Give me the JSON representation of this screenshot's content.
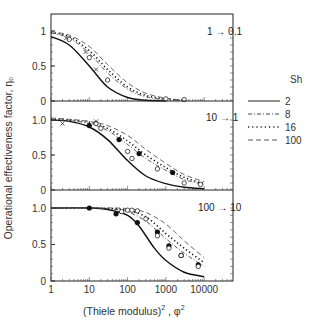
{
  "chart_data": {
    "type": "line",
    "title": "",
    "xlabel": "(Thiele modulus)^2 , φ^2",
    "xlabel_parts": {
      "main": "(Thiele modulus)",
      "sup1": "2",
      "sep": " , φ",
      "sup2": "2"
    },
    "ylabel": "Operational effectiveness factor, η₀",
    "xscale": "log",
    "xlim": [
      1,
      50000
    ],
    "x_ticks": [
      "1",
      "10",
      "100",
      "1000",
      "10000"
    ],
    "legend": {
      "title": "Sh",
      "position": "right",
      "entries": [
        {
          "label": "2",
          "style": "solid"
        },
        {
          "label": "8",
          "style": "dash-dot"
        },
        {
          "label": "16",
          "style": "dotted"
        },
        {
          "label": "100",
          "style": "dashed"
        }
      ]
    },
    "panels": [
      {
        "annotation": "1 → 0.1",
        "y_ticks": [
          "0",
          "0.5",
          "1"
        ],
        "ylim": [
          0,
          1.1
        ],
        "series": [
          {
            "name": "Sh=2",
            "x": [
              1,
              3,
              10,
              30,
              100,
              300,
              1000
            ],
            "y": [
              0.92,
              0.8,
              0.5,
              0.2,
              0.05,
              0.01,
              0.0
            ]
          },
          {
            "name": "Sh=8",
            "x": [
              1,
              3,
              10,
              30,
              100,
              300,
              1000,
              3000
            ],
            "y": [
              0.97,
              0.9,
              0.68,
              0.4,
              0.17,
              0.06,
              0.02,
              0.01
            ]
          },
          {
            "name": "Sh=16",
            "x": [
              1,
              3,
              10,
              30,
              100,
              300,
              1000,
              3000
            ],
            "y": [
              0.98,
              0.92,
              0.72,
              0.45,
              0.2,
              0.08,
              0.03,
              0.01
            ]
          },
          {
            "name": "Sh=100",
            "x": [
              1,
              3,
              10,
              30,
              100,
              300,
              1000,
              3000
            ],
            "y": [
              0.99,
              0.94,
              0.78,
              0.52,
              0.26,
              0.11,
              0.04,
              0.01
            ]
          }
        ],
        "points": {
          "open_circle": [
            [
              3,
              0.88
            ],
            [
              10,
              0.62
            ],
            [
              30,
              0.3
            ],
            [
              1000,
              0.03
            ],
            [
              3000,
              0.02
            ]
          ],
          "cross": [
            [
              2.5,
              0.9
            ],
            [
              8,
              0.7
            ],
            [
              15,
              0.45
            ]
          ]
        }
      },
      {
        "annotation": "10 → 1",
        "y_ticks": [
          "0",
          "0.5",
          "1.0"
        ],
        "ylim": [
          0,
          1.1
        ],
        "series": [
          {
            "name": "Sh=2",
            "x": [
              1,
              3,
              10,
              30,
              100,
              300,
              1000,
              3000,
              10000
            ],
            "y": [
              1.0,
              0.98,
              0.9,
              0.72,
              0.42,
              0.2,
              0.09,
              0.04,
              0.02
            ]
          },
          {
            "name": "Sh=8",
            "x": [
              1,
              3,
              10,
              30,
              100,
              300,
              1000,
              3000,
              10000
            ],
            "y": [
              1.0,
              0.99,
              0.95,
              0.85,
              0.65,
              0.45,
              0.28,
              0.15,
              0.08
            ]
          },
          {
            "name": "Sh=16",
            "x": [
              1,
              3,
              10,
              30,
              100,
              300,
              1000,
              3000,
              10000
            ],
            "y": [
              1.02,
              1.0,
              0.97,
              0.88,
              0.7,
              0.5,
              0.32,
              0.18,
              0.09
            ]
          },
          {
            "name": "Sh=100",
            "x": [
              1,
              3,
              10,
              30,
              100,
              300,
              1000,
              3000,
              10000
            ],
            "y": [
              1.03,
              1.01,
              0.98,
              0.92,
              0.78,
              0.58,
              0.38,
              0.22,
              0.12
            ]
          }
        ],
        "points": {
          "filled_circle": [
            [
              10,
              0.92
            ],
            [
              60,
              0.72
            ],
            [
              200,
              0.52
            ],
            [
              1500,
              0.25
            ]
          ],
          "open_circle": [
            [
              15,
              0.95
            ],
            [
              20,
              0.88
            ],
            [
              100,
              0.55
            ],
            [
              130,
              0.45
            ],
            [
              600,
              0.3
            ],
            [
              3000,
              0.1
            ],
            [
              8000,
              0.08
            ]
          ],
          "cross": [
            [
              2,
              0.95
            ],
            [
              15,
              0.98
            ]
          ]
        }
      },
      {
        "annotation": "100 → 10",
        "y_ticks": [
          "0",
          "0.5",
          "1.0"
        ],
        "ylim": [
          0,
          1.1
        ],
        "series": [
          {
            "name": "Sh=2",
            "x": [
              1,
              10,
              30,
              100,
              200,
              500,
              1000,
              3000,
              10000
            ],
            "y": [
              1.0,
              1.0,
              0.98,
              0.9,
              0.75,
              0.45,
              0.28,
              0.12,
              0.06
            ]
          },
          {
            "name": "Sh=8",
            "x": [
              1,
              10,
              50,
              100,
              300,
              1000,
              3000,
              10000
            ],
            "y": [
              1.0,
              1.0,
              0.98,
              0.95,
              0.82,
              0.58,
              0.38,
              0.2
            ]
          },
          {
            "name": "Sh=16",
            "x": [
              1,
              10,
              50,
              100,
              300,
              1000,
              3000,
              10000
            ],
            "y": [
              1.0,
              1.0,
              0.99,
              0.97,
              0.88,
              0.65,
              0.45,
              0.25
            ]
          },
          {
            "name": "Sh=100",
            "x": [
              1,
              10,
              50,
              100,
              300,
              1000,
              3000,
              10000
            ],
            "y": [
              1.0,
              1.0,
              1.0,
              0.99,
              0.94,
              0.78,
              0.55,
              0.32
            ]
          }
        ],
        "points": {
          "filled_circle": [
            [
              10,
              1.0
            ],
            [
              50,
              0.92
            ],
            [
              180,
              0.8
            ],
            [
              600,
              0.67
            ],
            [
              1200,
              0.48
            ],
            [
              2500,
              0.35
            ],
            [
              7000,
              0.22
            ]
          ],
          "open_circle": [
            [
              70,
              0.95
            ],
            [
              100,
              0.97
            ],
            [
              130,
              0.97
            ],
            [
              180,
              0.96
            ],
            [
              300,
              0.85
            ],
            [
              600,
              0.62
            ],
            [
              1200,
              0.45
            ],
            [
              2500,
              0.35
            ],
            [
              7000,
              0.2
            ]
          ]
        }
      }
    ]
  },
  "labels": {
    "ylabel": "Operational effectiveness factor, η₀",
    "legend_title": "Sh",
    "legend_1": "2",
    "legend_2": "8",
    "legend_3": "16",
    "legend_4": "100",
    "x_main": "(Thiele modulus)",
    "x_sup1": "2",
    "x_sep": " , φ",
    "x_sup2": "2"
  }
}
